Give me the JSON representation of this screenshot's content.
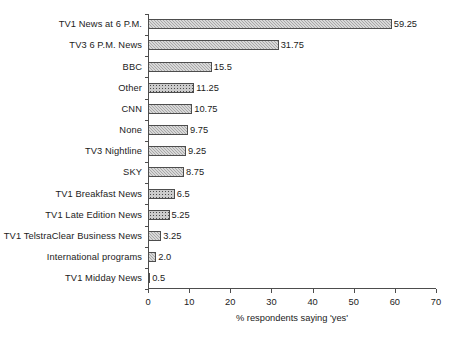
{
  "chart_data": {
    "type": "bar",
    "orientation": "horizontal",
    "title": "",
    "xlabel": "% respondents saying 'yes'",
    "ylabel": "",
    "xlim": [
      0,
      70
    ],
    "xticks": [
      0,
      10,
      20,
      30,
      40,
      50,
      60,
      70
    ],
    "grid": false,
    "legend": null,
    "categories": [
      "TV1 News at 6 P.M.",
      "TV3 6 P.M. News",
      "BBC",
      "Other",
      "CNN",
      "None",
      "TV3 Nightline",
      "SKY",
      "TV1 Breakfast News",
      "TV1 Late Edition News",
      "TV1 TelstraClear Business News",
      "International programs",
      "TV1 Midday News"
    ],
    "values": [
      59.25,
      31.75,
      15.5,
      11.25,
      10.75,
      9.75,
      9.25,
      8.75,
      6.5,
      5.25,
      3.25,
      2.0,
      0.5
    ],
    "value_labels": [
      "59.25",
      "31.75",
      "15.5",
      "11.25",
      "10.75",
      "9.75",
      "9.25",
      "8.75",
      "6.5",
      "5.25",
      "3.25",
      "2.0",
      "0.5"
    ],
    "bar_patterns": [
      "hatch",
      "hatch",
      "hatch",
      "dots",
      "hatch",
      "hatch",
      "hatch",
      "hatch",
      "dots",
      "dots",
      "hatch",
      "hatch",
      "hatch"
    ],
    "colors": {
      "bar_fill": "#a8a8a8",
      "bar_fill_dotted": "#cccccc",
      "bar_border": "#4d4d4d",
      "axis": "#4d4d4d",
      "text": "#1b1b1b",
      "background": "#ffffff"
    }
  }
}
